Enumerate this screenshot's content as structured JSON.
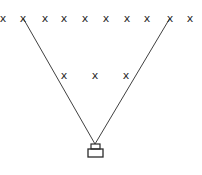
{
  "diagram": {
    "marker_glyph": "x",
    "top_row": {
      "y": 22,
      "xs": [
        3,
        23,
        45,
        64,
        85,
        106,
        127,
        147,
        170,
        190
      ]
    },
    "middle_row": {
      "y": 79,
      "xs": [
        64,
        95,
        126
      ]
    },
    "apex": {
      "x": 95,
      "y": 144
    },
    "rays": [
      {
        "from": [
          23,
          18
        ],
        "to": [
          95,
          144
        ]
      },
      {
        "from": [
          170,
          18
        ],
        "to": [
          95,
          144
        ]
      }
    ],
    "device": {
      "top_box": {
        "x": 91,
        "y": 144,
        "w": 9,
        "h": 5
      },
      "bottom_box": {
        "x": 88,
        "y": 149,
        "w": 15,
        "h": 8
      }
    },
    "colors": {
      "stroke": "#2a2a2a",
      "background": "#ffffff"
    }
  }
}
